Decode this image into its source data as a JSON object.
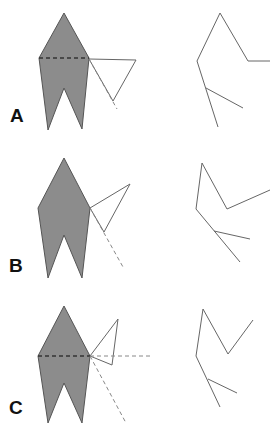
{
  "figure": {
    "colors": {
      "fill": "#8c8c8c",
      "stroke": "#555555",
      "line": "#666666",
      "dashed_dark": "#333333",
      "dashed_light": "#888888"
    },
    "panels": [
      {
        "label": "A",
        "label_pos": [
          10,
          122
        ],
        "shape": "39,58 64,13 89,58 82,129 64,88 48,130",
        "dashed_horizontal": [
          39,
          58,
          89,
          58
        ],
        "triangle": "89,59 136,60 113,101",
        "dashed_diagonal": [
          89,
          59,
          117,
          109
        ],
        "dashed_extension": null,
        "skeleton": {
          "main": "270,61 248,61 220,13 197,61 218,127",
          "branch": [
            206,
            88,
            243,
            108
          ]
        }
      },
      {
        "label": "B",
        "label_pos": [
          9,
          272
        ],
        "shape": "38,208 64,158 90,208 82,278 64,235 48,278",
        "dashed_horizontal": null,
        "triangle": "90,208 130,184 104,232",
        "dashed_diagonal": [
          90,
          208,
          123,
          267
        ],
        "dashed_extension": null,
        "skeleton": {
          "main": "270,190 227,209 202,163 196,209 240,262",
          "branch": [
            214,
            231,
            250,
            239
          ]
        }
      },
      {
        "label": "C",
        "label_pos": [
          9,
          414
        ],
        "shape": "38,356 64,306 90,356 82,423 64,383 48,423",
        "dashed_horizontal": [
          38,
          356,
          90,
          356
        ],
        "triangle": "90,356 118,319 112,365",
        "dashed_diagonal": [
          90,
          356,
          126,
          423
        ],
        "dashed_extension": [
          90,
          356,
          153,
          356
        ],
        "skeleton": {
          "main": "253,320 228,354 203,309 196,356 220,407",
          "branch": [
            208,
            379,
            237,
            393
          ]
        }
      }
    ]
  }
}
